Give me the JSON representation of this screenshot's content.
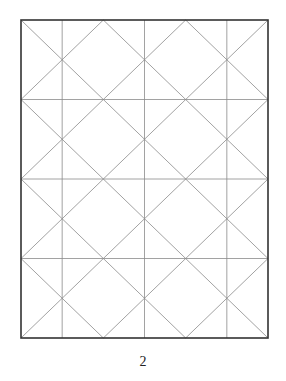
{
  "diagram": {
    "frame": {
      "x": 21,
      "y": 20,
      "width": 247,
      "height": 318
    },
    "grid": {
      "columns": 6,
      "rows": 8,
      "vertical_lines_at_units": [
        1,
        3,
        5
      ],
      "horizontal_lines_at_units": [
        2,
        4,
        6
      ],
      "diagonal_offsets": "even lattice (u±v even), slope ±1 in grid units"
    },
    "colors": {
      "frame": "#333333",
      "grid_lines": "#8a8a8a",
      "background": "#ffffff"
    }
  },
  "page": {
    "number": "2"
  }
}
